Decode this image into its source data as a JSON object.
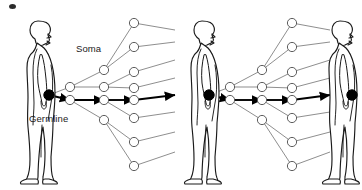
{
  "figure": {
    "type": "diagram",
    "background_color": "#ffffff",
    "line_color": "#7a7a7a",
    "bold_line_color": "#000000",
    "node_fill": "#ffffff",
    "node_stroke": "#555555",
    "germline_node_color": "#000000",
    "body_outline_color": "#1a1a1a"
  },
  "labels": {
    "soma": "Soma",
    "germline": "Germline"
  },
  "organisms": [
    {
      "name": "organism-generation-1",
      "x": 46,
      "y": 95,
      "height": 168,
      "facing": "right"
    },
    {
      "name": "organism-generation-2",
      "x": 210,
      "y": 95,
      "height": 168,
      "facing": "right"
    },
    {
      "name": "organism-generation-3",
      "x": 348,
      "y": 95,
      "height": 168,
      "facing": "right"
    }
  ],
  "germline_chain": {
    "description": "Bold black arrows connecting filled black germline cells through each generation",
    "nodes": [
      {
        "name": "germline-zygote-gen1",
        "x": 49,
        "y": 95,
        "r": 5.2,
        "filled": true
      },
      {
        "name": "germline-zygote-gen2",
        "x": 209,
        "y": 95,
        "r": 5.2,
        "filled": true
      },
      {
        "name": "germline-zygote-gen3",
        "x": 352,
        "y": 95,
        "r": 5.2,
        "filled": true
      }
    ]
  },
  "trees": [
    {
      "name": "lineage-tree-generation-1",
      "root": {
        "x": 49,
        "y": 95
      },
      "germline_path": [
        {
          "x": 49,
          "y": 95
        },
        {
          "x": 70,
          "y": 100
        },
        {
          "x": 104,
          "y": 100
        },
        {
          "x": 134,
          "y": 100
        }
      ],
      "soma_nodes": [
        {
          "name": "soma-node",
          "x": 70,
          "y": 87,
          "r": 4.6
        },
        {
          "name": "soma-node",
          "x": 70,
          "y": 100,
          "r": 4.6
        },
        {
          "name": "soma-node",
          "x": 104,
          "y": 70,
          "r": 4.6
        },
        {
          "name": "soma-node",
          "x": 104,
          "y": 87,
          "r": 4.6
        },
        {
          "name": "soma-node",
          "x": 104,
          "y": 100,
          "r": 4.6
        },
        {
          "name": "soma-node",
          "x": 104,
          "y": 120,
          "r": 4.6
        },
        {
          "name": "soma-node",
          "x": 134,
          "y": 23,
          "r": 4.6
        },
        {
          "name": "soma-node",
          "x": 134,
          "y": 47,
          "r": 4.6
        },
        {
          "name": "soma-node",
          "x": 134,
          "y": 72,
          "r": 4.6
        },
        {
          "name": "soma-node",
          "x": 134,
          "y": 88,
          "r": 4.6
        },
        {
          "name": "soma-node",
          "x": 134,
          "y": 100,
          "r": 4.6
        },
        {
          "name": "soma-node",
          "x": 134,
          "y": 118,
          "r": 4.6
        },
        {
          "name": "soma-node",
          "x": 134,
          "y": 142,
          "r": 4.6
        },
        {
          "name": "soma-node",
          "x": 134,
          "y": 166,
          "r": 4.6
        }
      ],
      "edges": [
        {
          "from": [
            49,
            95
          ],
          "to": [
            70,
            87
          ],
          "bold": false
        },
        {
          "from": [
            49,
            95
          ],
          "to": [
            70,
            100
          ],
          "bold": true
        },
        {
          "from": [
            70,
            87
          ],
          "to": [
            104,
            70
          ],
          "bold": false
        },
        {
          "from": [
            70,
            87
          ],
          "to": [
            104,
            87
          ],
          "bold": false
        },
        {
          "from": [
            70,
            100
          ],
          "to": [
            104,
            100
          ],
          "bold": true
        },
        {
          "from": [
            70,
            100
          ],
          "to": [
            104,
            120
          ],
          "bold": false
        },
        {
          "from": [
            104,
            70
          ],
          "to": [
            134,
            23
          ],
          "bold": false
        },
        {
          "from": [
            104,
            70
          ],
          "to": [
            134,
            47
          ],
          "bold": false
        },
        {
          "from": [
            104,
            87
          ],
          "to": [
            134,
            72
          ],
          "bold": false
        },
        {
          "from": [
            104,
            87
          ],
          "to": [
            134,
            88
          ],
          "bold": false
        },
        {
          "from": [
            104,
            100
          ],
          "to": [
            134,
            100
          ],
          "bold": true
        },
        {
          "from": [
            104,
            100
          ],
          "to": [
            134,
            118
          ],
          "bold": false
        },
        {
          "from": [
            104,
            120
          ],
          "to": [
            134,
            142
          ],
          "bold": false
        },
        {
          "from": [
            104,
            120
          ],
          "to": [
            134,
            166
          ],
          "bold": false
        },
        {
          "from": [
            134,
            23
          ],
          "to": [
            175,
            30
          ],
          "bold": false
        },
        {
          "from": [
            134,
            47
          ],
          "to": [
            175,
            42
          ],
          "bold": false
        },
        {
          "from": [
            134,
            72
          ],
          "to": [
            175,
            60
          ],
          "bold": false
        },
        {
          "from": [
            134,
            88
          ],
          "to": [
            175,
            78
          ],
          "bold": false
        },
        {
          "from": [
            134,
            100
          ],
          "to": [
            175,
            95
          ],
          "bold": true
        },
        {
          "from": [
            134,
            118
          ],
          "to": [
            175,
            112
          ],
          "bold": false
        },
        {
          "from": [
            134,
            142
          ],
          "to": [
            175,
            132
          ],
          "bold": false
        },
        {
          "from": [
            134,
            166
          ],
          "to": [
            175,
            152
          ],
          "bold": false
        }
      ]
    },
    {
      "name": "lineage-tree-generation-2",
      "root": {
        "x": 209,
        "y": 95
      },
      "germline_path": [
        {
          "x": 209,
          "y": 95
        },
        {
          "x": 230,
          "y": 100
        },
        {
          "x": 262,
          "y": 100
        },
        {
          "x": 292,
          "y": 100
        }
      ],
      "soma_nodes": [
        {
          "name": "soma-node",
          "x": 230,
          "y": 87,
          "r": 4.6
        },
        {
          "name": "soma-node",
          "x": 230,
          "y": 100,
          "r": 4.6
        },
        {
          "name": "soma-node",
          "x": 262,
          "y": 70,
          "r": 4.6
        },
        {
          "name": "soma-node",
          "x": 262,
          "y": 87,
          "r": 4.6
        },
        {
          "name": "soma-node",
          "x": 262,
          "y": 100,
          "r": 4.6
        },
        {
          "name": "soma-node",
          "x": 262,
          "y": 120,
          "r": 4.6
        },
        {
          "name": "soma-node",
          "x": 292,
          "y": 23,
          "r": 4.6
        },
        {
          "name": "soma-node",
          "x": 292,
          "y": 47,
          "r": 4.6
        },
        {
          "name": "soma-node",
          "x": 292,
          "y": 72,
          "r": 4.6
        },
        {
          "name": "soma-node",
          "x": 292,
          "y": 88,
          "r": 4.6
        },
        {
          "name": "soma-node",
          "x": 292,
          "y": 100,
          "r": 4.6
        },
        {
          "name": "soma-node",
          "x": 292,
          "y": 118,
          "r": 4.6
        },
        {
          "name": "soma-node",
          "x": 292,
          "y": 142,
          "r": 4.6
        },
        {
          "name": "soma-node",
          "x": 292,
          "y": 166,
          "r": 4.6
        }
      ],
      "edges": [
        {
          "from": [
            209,
            95
          ],
          "to": [
            230,
            87
          ],
          "bold": false
        },
        {
          "from": [
            209,
            95
          ],
          "to": [
            230,
            100
          ],
          "bold": true
        },
        {
          "from": [
            230,
            87
          ],
          "to": [
            262,
            70
          ],
          "bold": false
        },
        {
          "from": [
            230,
            87
          ],
          "to": [
            262,
            87
          ],
          "bold": false
        },
        {
          "from": [
            230,
            100
          ],
          "to": [
            262,
            100
          ],
          "bold": true
        },
        {
          "from": [
            230,
            100
          ],
          "to": [
            262,
            120
          ],
          "bold": false
        },
        {
          "from": [
            262,
            70
          ],
          "to": [
            292,
            23
          ],
          "bold": false
        },
        {
          "from": [
            262,
            70
          ],
          "to": [
            292,
            47
          ],
          "bold": false
        },
        {
          "from": [
            262,
            87
          ],
          "to": [
            292,
            72
          ],
          "bold": false
        },
        {
          "from": [
            262,
            87
          ],
          "to": [
            292,
            88
          ],
          "bold": false
        },
        {
          "from": [
            262,
            100
          ],
          "to": [
            292,
            100
          ],
          "bold": true
        },
        {
          "from": [
            262,
            100
          ],
          "to": [
            292,
            118
          ],
          "bold": false
        },
        {
          "from": [
            262,
            120
          ],
          "to": [
            292,
            142
          ],
          "bold": false
        },
        {
          "from": [
            262,
            120
          ],
          "to": [
            292,
            166
          ],
          "bold": false
        },
        {
          "from": [
            292,
            23
          ],
          "to": [
            330,
            30
          ],
          "bold": false
        },
        {
          "from": [
            292,
            47
          ],
          "to": [
            330,
            42
          ],
          "bold": false
        },
        {
          "from": [
            292,
            72
          ],
          "to": [
            330,
            60
          ],
          "bold": false
        },
        {
          "from": [
            292,
            88
          ],
          "to": [
            330,
            78
          ],
          "bold": false
        },
        {
          "from": [
            292,
            100
          ],
          "to": [
            330,
            95
          ],
          "bold": true
        },
        {
          "from": [
            292,
            118
          ],
          "to": [
            330,
            112
          ],
          "bold": false
        },
        {
          "from": [
            292,
            142
          ],
          "to": [
            330,
            132
          ],
          "bold": false
        },
        {
          "from": [
            292,
            166
          ],
          "to": [
            330,
            152
          ],
          "bold": false
        }
      ]
    }
  ],
  "artifact": {
    "name": "top-left-speck",
    "x": 9,
    "y": 4,
    "w": 7,
    "h": 5
  }
}
